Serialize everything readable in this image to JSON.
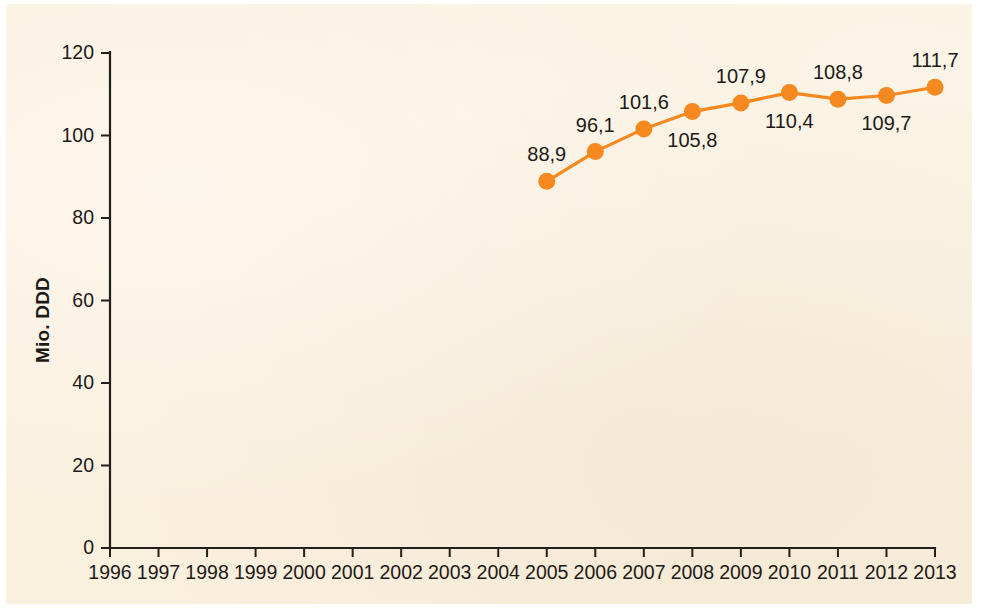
{
  "chart_data": {
    "type": "line",
    "title": "",
    "subtitle": "",
    "xlabel": "",
    "ylabel": "Mio. DDD",
    "xlim": [
      1996,
      2013
    ],
    "ylim": [
      0,
      120
    ],
    "grid": false,
    "legend": "none",
    "decimal_separator": ",",
    "x_tick_labels": [
      "1996",
      "1997",
      "1998",
      "1999",
      "2000",
      "2001",
      "2002",
      "2003",
      "2004",
      "2005",
      "2006",
      "2007",
      "2008",
      "2009",
      "2010",
      "2011",
      "2012",
      "2013"
    ],
    "y_tick_labels": [
      "0",
      "20",
      "40",
      "60",
      "80",
      "100",
      "120"
    ],
    "y_ticks": [
      0,
      20,
      40,
      60,
      80,
      100,
      120
    ],
    "series": [
      {
        "name": "Mio. DDD",
        "color": "#f5881f",
        "marker": "circle",
        "points": [
          {
            "x": 2005,
            "y": 88.9,
            "label": "88,9",
            "label_pos": "above"
          },
          {
            "x": 2006,
            "y": 96.1,
            "label": "96,1",
            "label_pos": "above"
          },
          {
            "x": 2007,
            "y": 101.6,
            "label": "101,6",
            "label_pos": "above"
          },
          {
            "x": 2008,
            "y": 105.8,
            "label": "105,8",
            "label_pos": "below"
          },
          {
            "x": 2009,
            "y": 107.9,
            "label": "107,9",
            "label_pos": "above"
          },
          {
            "x": 2010,
            "y": 110.4,
            "label": "110,4",
            "label_pos": "below"
          },
          {
            "x": 2011,
            "y": 108.8,
            "label": "108,8",
            "label_pos": "above"
          },
          {
            "x": 2012,
            "y": 109.7,
            "label": "109,7",
            "label_pos": "below"
          },
          {
            "x": 2013,
            "y": 111.7,
            "label": "111,7",
            "label_pos": "above"
          }
        ]
      }
    ],
    "colors": {
      "series": "#f5881f",
      "axis": "#231f1c",
      "text": "#1d1a17",
      "background": "#faf0de",
      "page": "#ffffff"
    }
  }
}
